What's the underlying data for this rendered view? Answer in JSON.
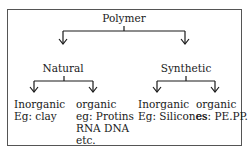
{
  "diagram": {
    "root": {
      "label": "Polymer"
    },
    "branches": [
      {
        "label": "Natural",
        "children": [
          {
            "label": "Inorganic",
            "example": [
              "Eg: clay"
            ]
          },
          {
            "label": "organic",
            "example": [
              "eg: Protins",
              "RNA DNA",
              "etc."
            ]
          }
        ]
      },
      {
        "label": "Synthetic",
        "children": [
          {
            "label": "Inorganic",
            "example": [
              "Eg: Silicones"
            ]
          },
          {
            "label": "organic",
            "example": [
              "es: PE.PP."
            ]
          }
        ]
      }
    ],
    "colors": {
      "line": "#1a1a1a",
      "border": "#555555",
      "background": "#ffffff"
    }
  }
}
